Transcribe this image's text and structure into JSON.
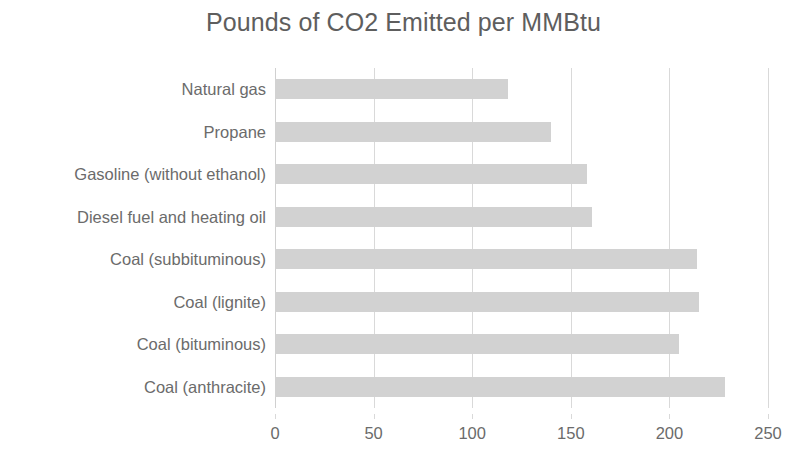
{
  "chart_data": {
    "type": "bar",
    "orientation": "horizontal",
    "title": "Pounds of CO2 Emitted per MMBtu",
    "xlabel": "",
    "ylabel": "",
    "categories": [
      "Natural gas",
      "Propane",
      "Gasoline (without ethanol)",
      "Diesel fuel and heating oil",
      "Coal (subbituminous)",
      "Coal (lignite)",
      "Coal (bituminous)",
      "Coal (anthracite)"
    ],
    "values": [
      118,
      140,
      158,
      161,
      214,
      215,
      205,
      228
    ],
    "xlim": [
      0,
      250
    ],
    "xticks": [
      0,
      50,
      100,
      150,
      200,
      250
    ],
    "xtick_labels": [
      "0",
      "50",
      "100",
      "150",
      "200",
      "250"
    ],
    "grid": "vertical",
    "legend": "none",
    "bar_color": "#d2d2d2",
    "text_color": "#6b6b6b",
    "title_color": "#5e5e5e",
    "gridline_color": "#d9d9d9",
    "background": "#ffffff"
  }
}
